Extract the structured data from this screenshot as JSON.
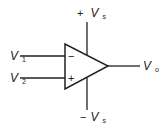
{
  "diagram": {
    "type": "op-amp schematic",
    "labels": {
      "v_plus_supply": {
        "sign": "+",
        "main": "V",
        "sub": "s"
      },
      "v_minus_supply": {
        "sign": "−",
        "main": "V",
        "sub": "s"
      },
      "input_1": {
        "main": "V",
        "sub": "1"
      },
      "input_2": {
        "main": "V",
        "sub": "2"
      },
      "output": {
        "main": "V",
        "sub": "o"
      },
      "inverting_sign": "−",
      "noninverting_sign": "+"
    },
    "stroke_color": "#222222"
  }
}
